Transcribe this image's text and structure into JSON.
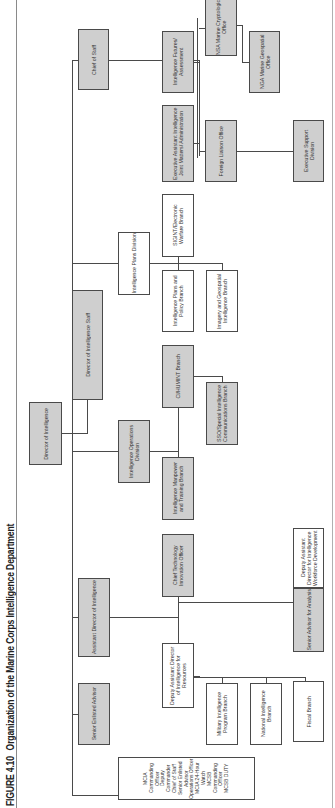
{
  "figure": {
    "number": "FIGURE 4.10",
    "title": "Organization of the Marine Corps Intelligence Department"
  },
  "colors": {
    "staff_box": "#cfcfcf",
    "unit_box": "#ffffff",
    "line": "#4a4a4a"
  },
  "chart": {
    "top": {
      "label": "Director of Intelligence",
      "style": "grey"
    },
    "staff": {
      "label": "Director of Intelligence Staff",
      "style": "grey"
    },
    "level1": [
      {
        "label": "Chief of Staff",
        "style": "grey"
      },
      {
        "label": "Intelligence Plans Division",
        "style": "white"
      },
      {
        "label": "Intelligence Operations Division",
        "style": "grey"
      },
      {
        "label": "Assistant Director of Intelligence",
        "style": "grey"
      },
      {
        "label": "Senior Enlisted Advisor",
        "style": "grey"
      },
      {
        "label": "MCIA Commanding Officer\nDeputy Commander\nChief of Staff\nSenior Enlisted Advisor\nOperations Officer\nMCIA 24-Hour Watch\nMCSB Commanding Officer\nMCSB DUTY",
        "style": "white"
      }
    ],
    "chief_of_staff_units": [
      {
        "label": "Intelligence Futures/ Assessment",
        "style": "grey"
      },
      {
        "label": "Executive Assistant Intelligence Joint Matters/ Administration",
        "style": "grey"
      },
      {
        "label": "NSA Marine Cryptologic Office",
        "style": "grey"
      },
      {
        "label": "NGA Marine Geospatial Office",
        "style": "grey"
      },
      {
        "label": "Foreign Liaison Office",
        "style": "grey"
      },
      {
        "label": "Executive Support Division",
        "style": "grey"
      }
    ],
    "plans_division_units": [
      {
        "label": "SIGINT/Electronic Warfare Branch",
        "style": "white"
      },
      {
        "label": "Intelligence Plans and Policy Branch",
        "style": "white"
      },
      {
        "label": "Imagery and Geospatial Intelligence Branch",
        "style": "white"
      }
    ],
    "operations_division_units": [
      {
        "label": "CI/HUMINT Branch",
        "style": "grey"
      },
      {
        "label": "SSO/Special Intelligence Communications Branch",
        "style": "grey"
      },
      {
        "label": "Intelligence Manpower and Training Branch",
        "style": "grey"
      }
    ],
    "assistant_director_units": [
      {
        "label": "Chief Technology Innovation Officer",
        "style": "grey"
      },
      {
        "label": "Deputy Assistant Director of Intelligence for Resources",
        "style": "white"
      },
      {
        "label": "Senior Advisor for Analysis",
        "style": "grey"
      },
      {
        "label": "Deputy Assistant Director for Intelligence Workforce Development",
        "style": "white"
      }
    ],
    "resources_units": [
      {
        "label": "Military Intelligence Program Branch",
        "style": "white"
      },
      {
        "label": "National Intelligence Branch",
        "style": "white"
      },
      {
        "label": "Fiscal Branch",
        "style": "white"
      }
    ]
  }
}
